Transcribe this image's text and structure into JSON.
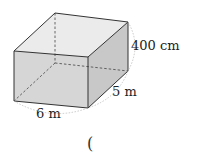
{
  "figure": {
    "type": "rectangular-prism",
    "dimensions": {
      "width_label": "6 m",
      "depth_label": "5 m",
      "height_label": "400 cm"
    },
    "answer_blank": "("
  },
  "colors": {
    "edge": "#333333",
    "front_face": "#d4d4d4",
    "side_face": "#c4c4c4",
    "top_face": "#e8e8e8",
    "guide_dotted": "#bbbbbb"
  }
}
